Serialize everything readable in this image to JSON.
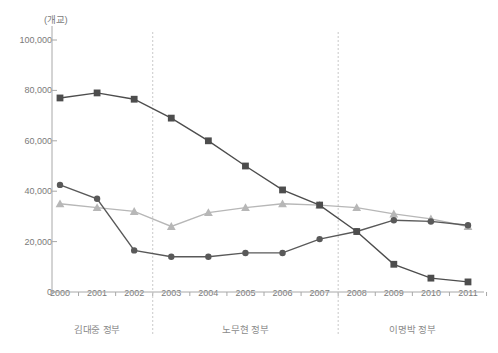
{
  "chart_data": {
    "type": "line",
    "title": "",
    "subtitle": "",
    "xlabel": "",
    "ylabel": "(개교)",
    "unit_label": "(개교)",
    "grid": false,
    "legend_position": "none",
    "categories": [
      "2000",
      "2001",
      "2002",
      "2003",
      "2004",
      "2005",
      "2006",
      "2007",
      "2008",
      "2009",
      "2010",
      "2011"
    ],
    "ylim": [
      0,
      100000
    ],
    "yticks": [
      0,
      20000,
      40000,
      60000,
      80000,
      100000
    ],
    "ytick_labels": [
      "0",
      "20,000",
      "40,000",
      "60,000",
      "80,000",
      "100,000"
    ],
    "series": [
      {
        "name": "series-square",
        "marker": "square",
        "color": "#4d4d4d",
        "values": [
          77000,
          79000,
          76500,
          69000,
          60000,
          50000,
          40500,
          34500,
          24000,
          11000,
          5500,
          4000
        ]
      },
      {
        "name": "series-circle",
        "marker": "circle",
        "color": "#595959",
        "values": [
          42500,
          37000,
          16500,
          14000,
          14000,
          15500,
          15500,
          21000,
          24000,
          28500,
          28000,
          26500
        ]
      },
      {
        "name": "series-triangle",
        "marker": "triangle",
        "color": "#b7b7b7",
        "values": [
          35000,
          33500,
          32000,
          26000,
          31500,
          33500,
          35000,
          34500,
          33500,
          31000,
          29000,
          26000
        ]
      }
    ],
    "annotations": [
      {
        "name": "era-kim-dae-jung",
        "label": "김대중 정부",
        "start": "2000",
        "end": "2002"
      },
      {
        "name": "era-roh-moo-hyun",
        "label": "노무현 정부",
        "start": "2003",
        "end": "2007"
      },
      {
        "name": "era-lee-myung-bak",
        "label": "이명박 정부",
        "start": "2008",
        "end": "2011"
      }
    ],
    "dividers": [
      {
        "name": "divider-2002-2003",
        "between": [
          "2002",
          "2003"
        ]
      },
      {
        "name": "divider-2007-2008",
        "between": [
          "2007",
          "2008"
        ]
      }
    ]
  }
}
